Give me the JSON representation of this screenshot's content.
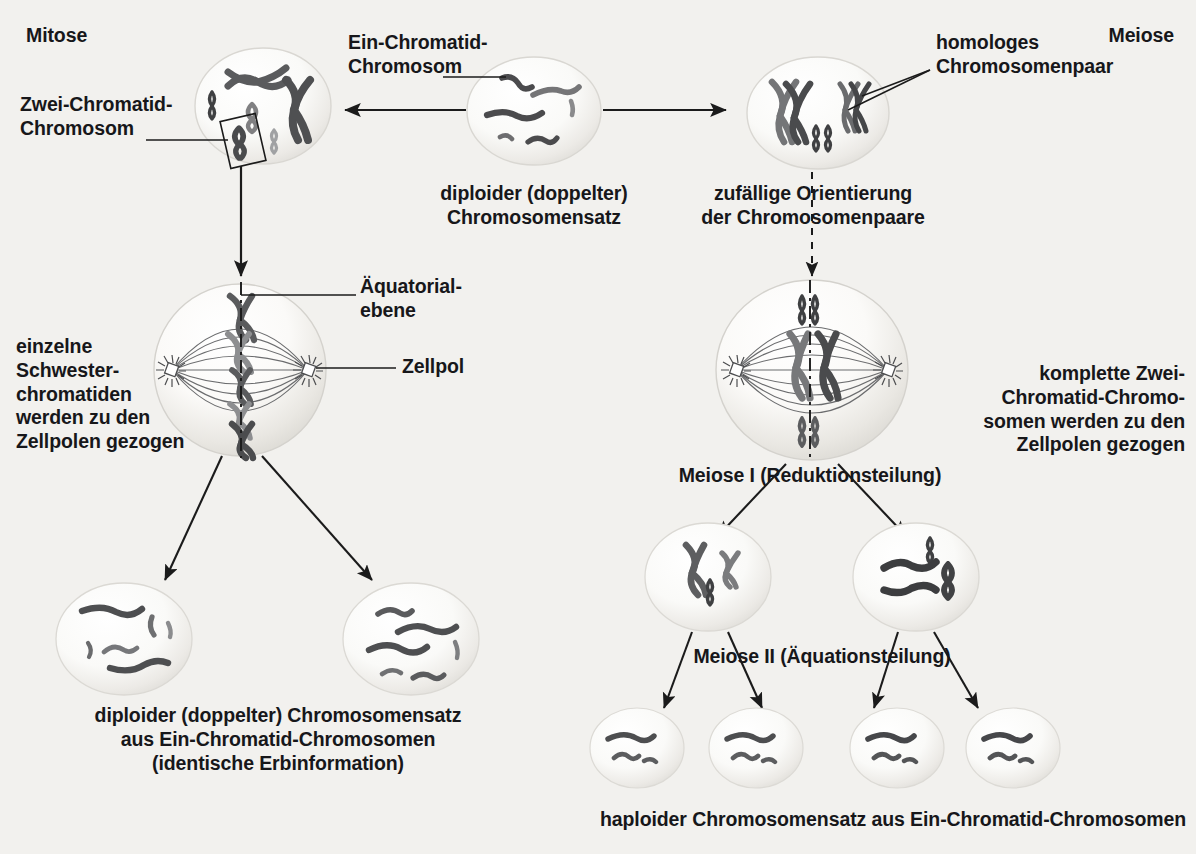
{
  "figure": {
    "title_left": "Mitose",
    "title_right": "Meiose",
    "background_color": "#f2f1ee",
    "chromosome_dark": "#3a3a3c",
    "chromosome_mid": "#6f7072",
    "chromosome_light": "#9a9b9d",
    "cell_fill": "#fbfbf9",
    "cell_edge": "#d4d3cf",
    "line_color": "#1b1b1b"
  },
  "labels": {
    "mitose": "Mitose",
    "meiose": "Meiose",
    "zwei_chromatid_chromosom": "Zwei-Chromatid-\nChromosom",
    "ein_chromatid_chromosom": "Ein-Chromatid-\nChromosom",
    "homologes_chromosomenpaar": "homologes\nChromosomenpaar",
    "diploider_satz": "diploider (doppelter)\nChromosomensatz",
    "zufaellige_orientierung": "zufällige Orientierung\nder Chromosomenpaare",
    "aequatorialebene": "Äquatorial-\nebene",
    "zellpol": "Zellpol",
    "einzelne_schwesterchromatiden": "einzelne\nSchwester-\nchromatiden\nwerden zu den\nZellpolen gezogen",
    "komplette_zwei_chromatid": "komplette Zwei-\nChromatid-Chromo-\nsomen werden zu den\nZellpolen gezogen",
    "meiose_i": "Meiose I (Reduktionsteilung)",
    "meiose_ii": "Meiose II (Äquationsteilung)",
    "mitose_ergebnis": "diploider (doppelter) Chromosomensatz\naus Ein-Chromatid-Chromosomen\n(identische Erbinformation)",
    "meiose_ergebnis": "haploider Chromosomensatz aus Ein-Chromatid-Chromosomen"
  },
  "cells": {
    "parent": {
      "name": "diploider Ausgangszelle",
      "chromosome_count": 6,
      "type": "ein-chromatid"
    },
    "mitosis_prophase": {
      "name": "Mitose Prophase",
      "chromosome_count": 6,
      "type": "zwei-chromatid"
    },
    "mitosis_metaphase": {
      "name": "Mitose Metaphase",
      "type": "zwei-chromatid",
      "plate": "Äquatorialebene"
    },
    "mitosis_daughters": 2,
    "meiosis_prophase": {
      "name": "Meiose Prophase I",
      "pairs": 3,
      "type": "homologe Paare"
    },
    "meiosis_metaphase": {
      "name": "Meiose Metaphase I",
      "pairs": 3
    },
    "meiosis_i_daughters": 2,
    "meiosis_ii_daughters": 4
  }
}
